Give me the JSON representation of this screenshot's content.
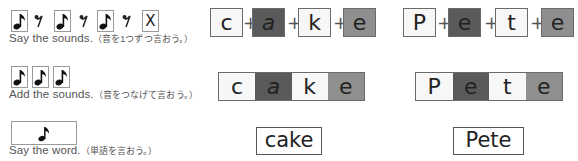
{
  "steps": [
    {
      "caption_en": "Say the sounds.",
      "caption_jp": "（音を1つずつ言おう。）",
      "icons": [
        "note-icon",
        "rest-icon",
        "note-icon",
        "rest-icon",
        "note-icon",
        "rest-icon",
        "x-icon"
      ],
      "x_label": "X"
    },
    {
      "caption_en": "Add the sounds.",
      "caption_jp": "（音をつなげて言おう。）",
      "icons": [
        "note-icon",
        "note-icon",
        "note-icon"
      ]
    },
    {
      "caption_en": "Say the word.",
      "caption_jp": "（単語を言おう。）",
      "icons": [
        "note-icon"
      ]
    }
  ],
  "plus_sign": "+",
  "words": [
    {
      "word": "cake",
      "letters": [
        {
          "char": "c",
          "shade": "white"
        },
        {
          "char": "a",
          "shade": "dark"
        },
        {
          "char": "k",
          "shade": "white"
        },
        {
          "char": "e",
          "shade": "mid"
        }
      ]
    },
    {
      "word": "Pete",
      "letters": [
        {
          "char": "P",
          "shade": "white"
        },
        {
          "char": "e",
          "shade": "dark"
        },
        {
          "char": "t",
          "shade": "white"
        },
        {
          "char": "e",
          "shade": "mid"
        }
      ]
    }
  ],
  "colors": {
    "white": "#f7f7f7",
    "dark": "#5a5a5a",
    "mid": "#8f8f8f"
  }
}
